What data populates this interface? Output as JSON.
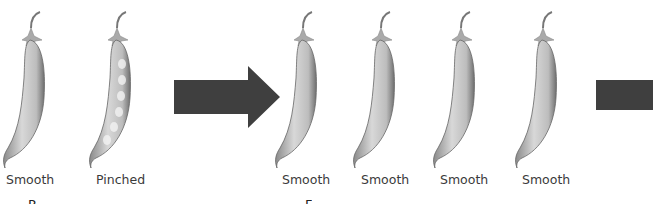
{
  "parental": {
    "pods": [
      {
        "label": "Smooth",
        "type": "smooth"
      },
      {
        "label": "Pinched",
        "type": "pinched"
      }
    ],
    "caption_fragment": "P"
  },
  "f1": {
    "pods": [
      {
        "label": "Smooth",
        "type": "smooth"
      },
      {
        "label": "Smooth",
        "type": "smooth"
      },
      {
        "label": "Smooth",
        "type": "smooth"
      },
      {
        "label": "Smooth",
        "type": "smooth"
      }
    ],
    "caption_fragment": "F"
  },
  "colors": {
    "arrow": "#3f3f3f",
    "pod_light": "#dcdcdc",
    "pod_dark": "#7a7a7a"
  }
}
